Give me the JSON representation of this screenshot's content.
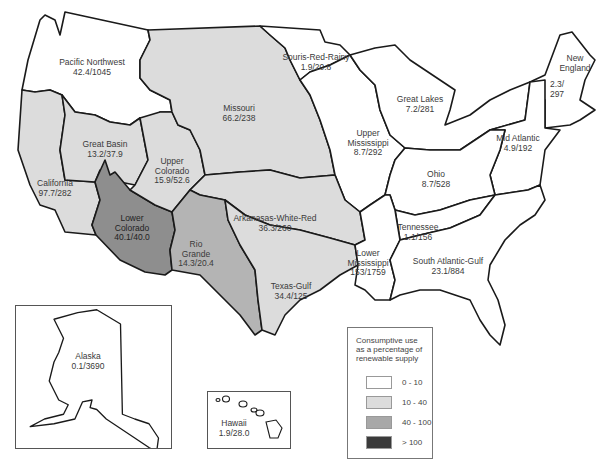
{
  "colors": {
    "class_0_10": "#ffffff",
    "class_10_40": "#dcdcdc",
    "class_40_100": "#a8a8a8",
    "class_gt_100": "#3a3a3a",
    "lower_colorado": "#8e8e8e",
    "rio_grande": "#b4b4b4",
    "border": "#1a1a1a"
  },
  "regions": [
    {
      "name": "Pacific Northwest",
      "value": "42.4/1045"
    },
    {
      "name": "Missouri",
      "value": "66.2/238"
    },
    {
      "name": "Souris-Red-Rainy",
      "value": "1.9/20.8"
    },
    {
      "name": "Great Lakes",
      "value": "7.2/281"
    },
    {
      "name": "New England",
      "value": "2.3/ 297"
    },
    {
      "name": "Great Basin",
      "value": "13.2/37.9"
    },
    {
      "name": "Upper Colorado",
      "value": "15.9/52.6"
    },
    {
      "name": "Upper Mississippi",
      "value": "8.7/292"
    },
    {
      "name": "Mid Atlantic",
      "value": "4.9/192"
    },
    {
      "name": "California",
      "value": "97.7/282"
    },
    {
      "name": "Ohio",
      "value": "8.7/528"
    },
    {
      "name": "Lower Colorado",
      "value": "40.1/40.0"
    },
    {
      "name": "Arkanasas-White-Red",
      "value": "36.3/260"
    },
    {
      "name": "Rio Grande",
      "value": "14.3/20.4"
    },
    {
      "name": "Tennessee",
      "value": "1.1/156"
    },
    {
      "name": "Lower Mississippi",
      "value": "153/1759"
    },
    {
      "name": "South Atlantic-Gulf",
      "value": "23.1/884"
    },
    {
      "name": "Texas-Gulf",
      "value": "34.4/125"
    },
    {
      "name": "Alaska",
      "value": "0.1/3690"
    },
    {
      "name": "Hawaii",
      "value": "1.9/28.0"
    }
  ],
  "labels": {
    "pnw": [
      "Pacific Northwest",
      "42.4/1045"
    ],
    "missouri": [
      "Missouri",
      "66.2/238"
    ],
    "souris": [
      "Souris-Red-Rainy",
      "1.9/20.8"
    ],
    "greatlakes": [
      "Great Lakes",
      "7.2/281"
    ],
    "newengland": [
      "New",
      "England",
      "2.3/",
      "297"
    ],
    "greatbasin": [
      "Great Basin",
      "13.2/37.9"
    ],
    "uppercolorado": [
      "Upper",
      "Colorado",
      "15.9/52.6"
    ],
    "uppermiss": [
      "Upper",
      "Mississippi",
      "8.7/292"
    ],
    "midatlantic": [
      "Mid Atlantic",
      "4.9/192"
    ],
    "california": [
      "California",
      "97.7/282"
    ],
    "ohio": [
      "Ohio",
      "8.7/528"
    ],
    "lowercolorado": [
      "Lower",
      "Colorado",
      "40.1/40.0"
    ],
    "awr": [
      "Arkanasas-White-Red",
      "36.3/260"
    ],
    "riogrande": [
      "Rio",
      "Grande",
      "14.3/20.4"
    ],
    "tennessee": [
      "Tennessee",
      "1.1/156"
    ],
    "lowermiss": [
      "Lower",
      "Mississippi",
      "153/1759"
    ],
    "sag": [
      "South Atlantic-Gulf",
      "23.1/884"
    ],
    "texasgulf": [
      "Texas-Gulf",
      "34.4/125"
    ],
    "alaska": [
      "Alaska",
      "0.1/3690"
    ],
    "hawaii": [
      "Hawaii",
      "1.9/28.0"
    ]
  },
  "legend": {
    "title_lines": [
      "Consumptive use",
      "as a  percentage of",
      "renewable supply"
    ],
    "items": [
      {
        "label": "0 - 10",
        "color": "#ffffff"
      },
      {
        "label": "10 - 40",
        "color": "#dcdcdc"
      },
      {
        "label": "40 - 100",
        "color": "#a8a8a8"
      },
      {
        "label": "> 100",
        "color": "#3a3a3a"
      }
    ]
  }
}
